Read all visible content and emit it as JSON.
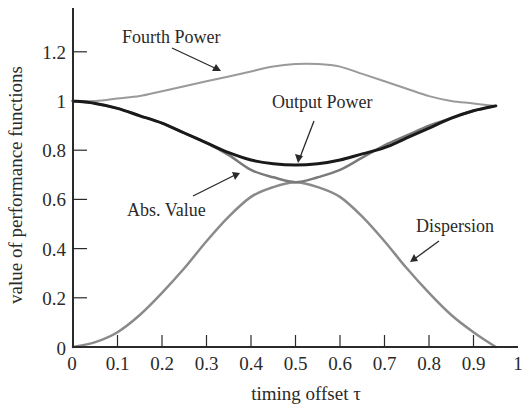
{
  "chart_data": {
    "type": "line",
    "title": "",
    "xlabel": "timing offset τ",
    "ylabel": "value of performance functions",
    "xlim": [
      0,
      1
    ],
    "ylim": [
      0,
      1.35
    ],
    "grid": false,
    "legend": "none (inline annotations with arrows)",
    "x_ticks": [
      "0",
      "0.1",
      "0.2",
      "0.3",
      "0.4",
      "0.5",
      "0.6",
      "0.7",
      "0.8",
      "0.9",
      "1"
    ],
    "y_ticks": [
      "0",
      "0.2",
      "0.4",
      "0.6",
      "0.8",
      "1",
      "1.2"
    ],
    "x": [
      0,
      0.05,
      0.1,
      0.15,
      0.2,
      0.25,
      0.3,
      0.35,
      0.4,
      0.45,
      0.5,
      0.55,
      0.6,
      0.65,
      0.7,
      0.75,
      0.8,
      0.85,
      0.9,
      0.95
    ],
    "series": [
      {
        "name": "Fourth Power",
        "color": "#9a9a9a",
        "width": 2,
        "values": [
          1.0,
          1.0,
          1.01,
          1.02,
          1.04,
          1.06,
          1.08,
          1.1,
          1.12,
          1.14,
          1.15,
          1.15,
          1.14,
          1.11,
          1.08,
          1.05,
          1.02,
          1.0,
          0.99,
          0.98
        ]
      },
      {
        "name": "Output Power",
        "color": "#1a1a1a",
        "width": 3,
        "values": [
          1.0,
          0.99,
          0.97,
          0.94,
          0.91,
          0.87,
          0.83,
          0.79,
          0.76,
          0.745,
          0.74,
          0.745,
          0.76,
          0.785,
          0.81,
          0.85,
          0.89,
          0.93,
          0.96,
          0.98
        ]
      },
      {
        "name": "Abs. Value",
        "color": "#7a7a7a",
        "width": 2.5,
        "values": [
          1.0,
          0.99,
          0.97,
          0.94,
          0.91,
          0.87,
          0.83,
          0.78,
          0.72,
          0.69,
          0.67,
          0.69,
          0.72,
          0.77,
          0.82,
          0.86,
          0.9,
          0.93,
          0.96,
          0.98
        ]
      },
      {
        "name": "Dispersion",
        "color": "#8a8a8a",
        "width": 2.5,
        "values": [
          0.0,
          0.02,
          0.06,
          0.13,
          0.22,
          0.32,
          0.43,
          0.53,
          0.61,
          0.65,
          0.67,
          0.65,
          0.61,
          0.53,
          0.43,
          0.32,
          0.22,
          0.13,
          0.06,
          0.0
        ]
      }
    ],
    "annotations": [
      {
        "text": "Fourth Power",
        "points_to": "Fourth Power",
        "x": 0.33,
        "y": 1.09
      },
      {
        "text": "Output Power",
        "points_to": "Output Power",
        "x": 0.5,
        "y": 0.74
      },
      {
        "text": "Abs. Value",
        "points_to": "Abs. Value",
        "x": 0.39,
        "y": 0.72
      },
      {
        "text": "Dispersion",
        "points_to": "Dispersion",
        "x": 0.78,
        "y": 0.25
      }
    ]
  }
}
